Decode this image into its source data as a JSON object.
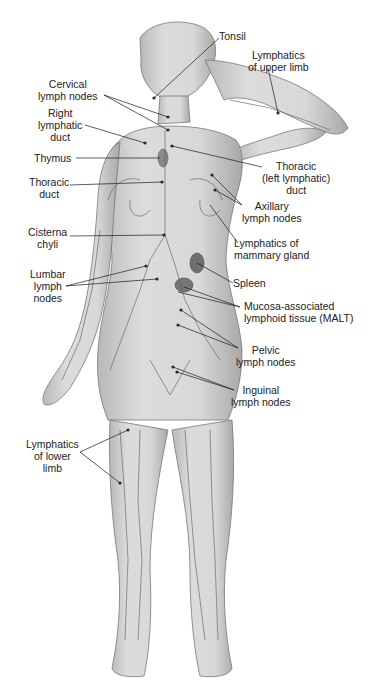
{
  "figure": {
    "colors": {
      "background": "#ffffff",
      "skin": "#d6d6d6",
      "skin_shadow": "#9a9a9a",
      "vessel": "#5a5a5a",
      "node": "#2a2a2a",
      "organ": "#6e6e6e",
      "text": "#222222"
    }
  },
  "labels": {
    "tonsil": "Tonsil",
    "upper_limb_1": "Lymphatics",
    "upper_limb_2": "of upper limb",
    "cervical_1": "Cervical",
    "cervical_2": "lymph nodes",
    "right_duct_1": "Right",
    "right_duct_2": "lymphatic",
    "right_duct_3": "duct",
    "thymus": "Thymus",
    "thoracic_duct_1": "Thoracic",
    "thoracic_duct_2": "duct",
    "thoracic_left_1": "Thoracic",
    "thoracic_left_2": "(left lymphatic)",
    "thoracic_left_3": "duct",
    "axillary_1": "Axillary",
    "axillary_2": "lymph nodes",
    "mammary_1": "Lymphatics of",
    "mammary_2": "mammary gland",
    "cisterna_1": "Cisterna",
    "cisterna_2": "chyli",
    "lumbar_1": "Lumbar",
    "lumbar_2": "lymph",
    "lumbar_3": "nodes",
    "spleen": "Spleen",
    "malt_1": "Mucosa-associated",
    "malt_2": "lymphoid tissue (MALT)",
    "pelvic_1": "Pelvic",
    "pelvic_2": "lymph nodes",
    "inguinal_1": "Inguinal",
    "inguinal_2": "lymph nodes",
    "lower_limb_1": "Lymphatics",
    "lower_limb_2": "of lower",
    "lower_limb_3": "limb"
  }
}
